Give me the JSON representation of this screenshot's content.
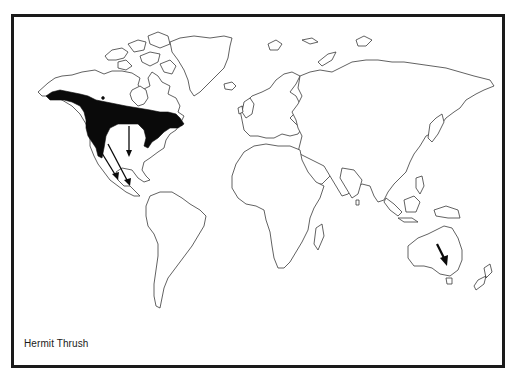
{
  "map": {
    "title": "Hermit Thrush",
    "type": "species range map",
    "projection": "world outline",
    "colors": {
      "range_fill": "#0a0a0a",
      "coastline": "#3a3a3a",
      "background": "#ffffff",
      "frame": "#1a1a1a"
    },
    "features": {
      "breeding_range": "North America (Alaska, Canada, western and northeastern United States)",
      "migration_arrows": [
        {
          "from": "Western North America",
          "to": "Mexico",
          "direction": "south-southeast"
        },
        {
          "from": "Western North America",
          "to": "Central America",
          "direction": "southeast"
        },
        {
          "from": "Central Canada / Great Lakes",
          "to": "Gulf Coast",
          "direction": "south"
        },
        {
          "from": "Eastern Canada",
          "to": "Atlantic coast",
          "direction": "southwest"
        }
      ],
      "vagrant_record": {
        "location": "Southeastern Australia",
        "marker": "arrow"
      }
    }
  }
}
